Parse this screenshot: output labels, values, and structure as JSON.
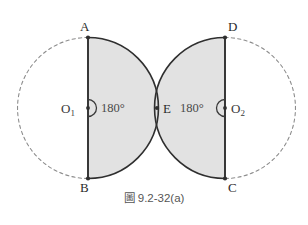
{
  "figure": {
    "caption": "圖 9.2-32(a)",
    "vertices": [
      {
        "id": "A",
        "label": "A",
        "x": 88,
        "y": 37,
        "label_x": 80,
        "label_y": 20
      },
      {
        "id": "B",
        "label": "B",
        "x": 88,
        "y": 178,
        "label_x": 80,
        "label_y": 181
      },
      {
        "id": "C",
        "label": "C",
        "x": 225,
        "y": 178,
        "label_x": 228,
        "label_y": 181
      },
      {
        "id": "D",
        "label": "D",
        "x": 225,
        "y": 37,
        "label_x": 228,
        "label_y": 20
      },
      {
        "id": "E",
        "label": "E",
        "x": 157,
        "y": 108,
        "label_x": 163,
        "label_y": 102
      }
    ],
    "centers": [
      {
        "id": "O1",
        "label": "O",
        "sub": "1",
        "x": 88,
        "y": 108,
        "label_x": 61,
        "label_y": 102
      },
      {
        "id": "O2",
        "label": "O",
        "sub": "2",
        "x": 225,
        "y": 108,
        "label_x": 231,
        "label_y": 102
      }
    ],
    "angles": [
      {
        "id": "angle-o1",
        "value": "180°",
        "label_x": 101,
        "label_y": 102
      },
      {
        "id": "angle-o2",
        "value": "180°",
        "label_x": 180,
        "label_y": 102
      }
    ],
    "colors": {
      "shaded_fill": "#e2e2e2",
      "solid_stroke": "#2f2f2f",
      "dashed_stroke": "#8d8d8d",
      "background": "#ffffff",
      "caption_text": "#555555"
    },
    "geometry": {
      "circle_radius": 70.5,
      "left_center_x": 88,
      "right_center_x": 225,
      "center_y": 108,
      "tangent_point_x": 157
    }
  }
}
